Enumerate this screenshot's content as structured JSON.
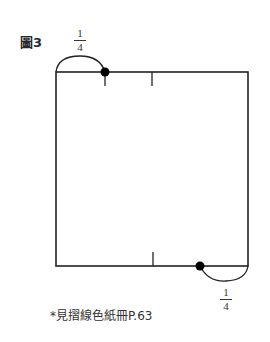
{
  "figure": {
    "label": "圖3",
    "top_fraction": {
      "numerator": "1",
      "denominator": "4"
    },
    "bottom_fraction": {
      "numerator": "1",
      "denominator": "4"
    },
    "caption": "*見摺線色紙冊P.63",
    "line_color": "#222222"
  }
}
